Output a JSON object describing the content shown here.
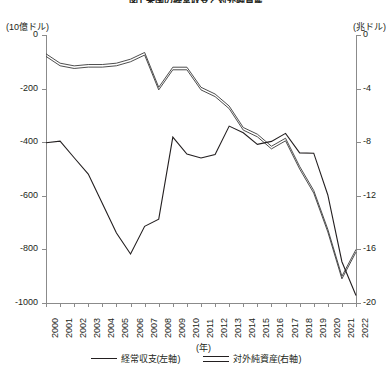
{
  "title": "図1 米国の経常収支と対外純資産",
  "axes": {
    "left_unit": "(10億ドル)",
    "right_unit": "(兆ドル)",
    "x_title": "(年)",
    "left_ticks": [
      "0",
      "-200",
      "-400",
      "-600",
      "-800",
      "-1000"
    ],
    "right_ticks": [
      "0",
      "-4",
      "-8",
      "-12",
      "-16",
      "-20"
    ]
  },
  "legend": {
    "series1_label": "経常収支(左軸)",
    "series2_label": "対外純資産(右軸)"
  },
  "chart_data": {
    "type": "line",
    "title": "図1 米国の経常収支と対外純資産",
    "xlabel": "(年)",
    "ylabel": "(10億ドル)",
    "y2label": "(兆ドル)",
    "ylim": [
      -1000,
      0
    ],
    "y2lim": [
      -20,
      0
    ],
    "grid": false,
    "legend_position": "bottom",
    "categories": [
      "2000",
      "2001",
      "2002",
      "2003",
      "2004",
      "2005",
      "2006",
      "2007",
      "2008",
      "2009",
      "2010",
      "2011",
      "2012",
      "2013",
      "2014",
      "2015",
      "2016",
      "2017",
      "2018",
      "2019",
      "2020",
      "2021",
      "2022"
    ],
    "series": [
      {
        "name": "経常収支(左軸)",
        "axis": "left",
        "unit": "10億ドル",
        "style": "single-line",
        "values": [
          -402,
          -396,
          -458,
          -519,
          -629,
          -739,
          -817,
          -714,
          -687,
          -381,
          -444,
          -459,
          -446,
          -340,
          -365,
          -408,
          -397,
          -367,
          -440,
          -441,
          -597,
          -846,
          -972
        ]
      },
      {
        "name": "対外純資産(右軸)",
        "axis": "right",
        "unit": "兆ドル",
        "style": "double-line",
        "values": [
          -1.5,
          -2.2,
          -2.4,
          -2.3,
          -2.3,
          -2.2,
          -1.9,
          -1.4,
          -4.0,
          -2.5,
          -2.5,
          -4.0,
          -4.5,
          -5.4,
          -7.0,
          -7.5,
          -8.4,
          -7.8,
          -9.9,
          -11.7,
          -14.6,
          -18.1,
          -16.1
        ]
      }
    ]
  }
}
